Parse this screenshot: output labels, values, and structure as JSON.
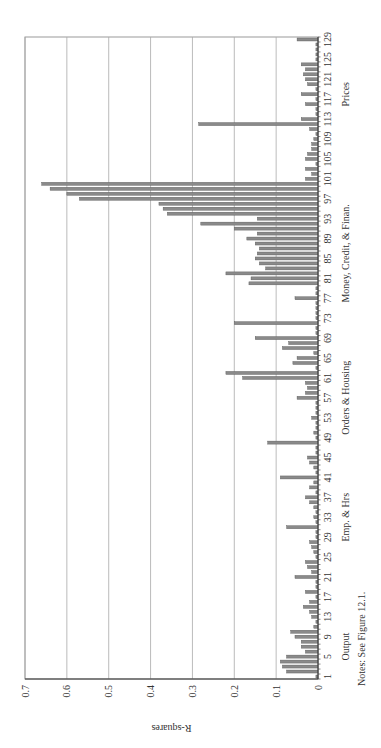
{
  "chart_data": {
    "type": "bar",
    "orientation": "rotated-90-ccw",
    "title": "",
    "xlabel": "",
    "ylabel": "R-squares",
    "ylim": [
      0,
      0.7
    ],
    "yticks": [
      "0",
      "0.1",
      "0.2",
      "0.3",
      "0.4",
      "0.5",
      "0.6",
      "0.7"
    ],
    "grid": true,
    "xtick_labels": [
      "1",
      "5",
      "9",
      "13",
      "17",
      "21",
      "25",
      "29",
      "33",
      "37",
      "41",
      "45",
      "49",
      "53",
      "57",
      "61",
      "65",
      "69",
      "73",
      "77",
      "81",
      "85",
      "89",
      "93",
      "97",
      "101",
      "105",
      "109",
      "113",
      "117",
      "121",
      "125",
      "129"
    ],
    "groups": [
      {
        "label": "Output",
        "center": 7
      },
      {
        "label": "Emp. & Hrs",
        "center": 33
      },
      {
        "label": "Orders & Housing",
        "center": 57
      },
      {
        "label": "Money, Credit, & Finan.",
        "center": 86
      },
      {
        "label": "Prices",
        "center": 118
      }
    ],
    "categories_count": 129,
    "values": [
      0.005,
      0.075,
      0.085,
      0.09,
      0.075,
      0.03,
      0.04,
      0.04,
      0.055,
      0.065,
      0.01,
      0.005,
      0.015,
      0.02,
      0.035,
      0.02,
      0.005,
      0.03,
      0.005,
      0.005,
      0.055,
      0.015,
      0.025,
      0.03,
      0.005,
      0.01,
      0.015,
      0.02,
      0.005,
      0.005,
      0.075,
      0.005,
      0.01,
      0.005,
      0.01,
      0.02,
      0.03,
      0.005,
      0.02,
      0.01,
      0.09,
      0.005,
      0.01,
      0.02,
      0.025,
      0.005,
      0.005,
      0.12,
      0.005,
      0.01,
      0.005,
      0.005,
      0.015,
      0.005,
      0.005,
      0.005,
      0.05,
      0.03,
      0.025,
      0.03,
      0.18,
      0.22,
      0.005,
      0.06,
      0.05,
      0.01,
      0.085,
      0.07,
      0.15,
      0.005,
      0.005,
      0.2,
      0.005,
      0.005,
      0.005,
      0.005,
      0.055,
      0.005,
      0.005,
      0.165,
      0.16,
      0.22,
      0.125,
      0.14,
      0.15,
      0.145,
      0.14,
      0.15,
      0.17,
      0.145,
      0.2,
      0.28,
      0.145,
      0.36,
      0.37,
      0.38,
      0.57,
      0.6,
      0.64,
      0.66,
      0.03,
      0.015,
      0.03,
      0.005,
      0.03,
      0.025,
      0.015,
      0.015,
      0.01,
      0.005,
      0.02,
      0.285,
      0.04,
      0.005,
      0.005,
      0.03,
      0.005,
      0.04,
      0.005,
      0.025,
      0.03,
      0.035,
      0.03,
      0.04,
      0.005,
      0.005,
      0.005,
      0.005,
      0.05
    ],
    "notes": "Notes: See Figure 12.1."
  }
}
